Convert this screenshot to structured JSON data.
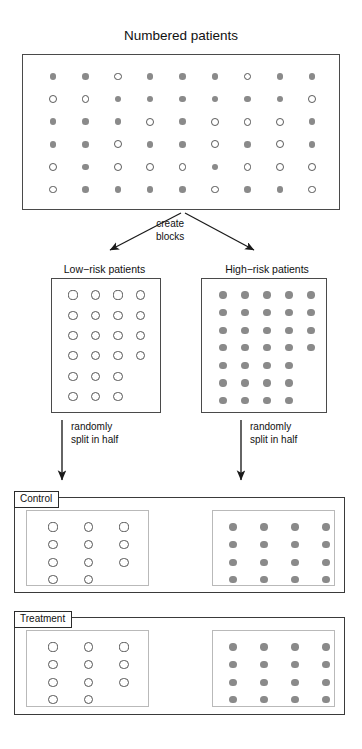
{
  "figure": {
    "title": "Numbered patients",
    "step_labels": {
      "create_blocks": "create\nblocks",
      "create_blocks_line1": "create",
      "create_blocks_line2": "blocks",
      "randomize_line1": "randomly",
      "randomize_line2": "split in half"
    },
    "block_labels": {
      "low": "Low−risk patients",
      "high": "High−risk patients"
    },
    "group_labels": {
      "control": "Control",
      "treatment": "Treatment"
    },
    "marker_legend": {
      "open": "low-risk patient",
      "filled": "high-risk patient"
    },
    "colors": {
      "filled_marker": "#8a8a8a",
      "open_marker_stroke": "#555555",
      "box_border": "#4a4a4a",
      "inner_box_border": "#b9b9b9",
      "arrow": "#1a1a1a",
      "background": "#ffffff",
      "text": "#111111"
    }
  },
  "chart_data": {
    "type": "diagram",
    "title": "Numbered patients",
    "marker_encoding": {
      "O": "open circle = low-risk patient",
      "F": "filled circle = high-risk patient"
    },
    "pool": {
      "label": "Numbered patients",
      "rows": 6,
      "cols": 9,
      "total": 54,
      "open_count": 22,
      "filled_count": 32,
      "grid": [
        [
          "F",
          "F",
          "O",
          "F",
          "F",
          "F",
          "O",
          "F",
          "F"
        ],
        [
          "O",
          "O",
          "F",
          "F",
          "F",
          "F",
          "F",
          "F",
          "O"
        ],
        [
          "F",
          "F",
          "F",
          "O",
          "F",
          "O",
          "O",
          "O",
          "F"
        ],
        [
          "F",
          "F",
          "O",
          "F",
          "F",
          "O",
          "F",
          "O",
          "F"
        ],
        [
          "O",
          "F",
          "O",
          "O",
          "O",
          "F",
          "O",
          "O",
          "O"
        ],
        [
          "O",
          "F",
          "F",
          "F",
          "F",
          "O",
          "F",
          "F",
          "O"
        ]
      ]
    },
    "blocks": [
      {
        "name": "Low−risk patients",
        "marker": "open",
        "total": 22,
        "row_counts": [
          4,
          4,
          4,
          4,
          3,
          3
        ]
      },
      {
        "name": "High−risk patients",
        "marker": "filled",
        "total": 32,
        "row_counts": [
          5,
          5,
          5,
          5,
          4,
          4,
          4
        ]
      }
    ],
    "groups": [
      {
        "name": "Control",
        "low_risk": {
          "marker": "open",
          "total": 11,
          "row_counts": [
            3,
            3,
            3,
            2
          ]
        },
        "high_risk": {
          "marker": "filled",
          "total": 16,
          "row_counts": [
            4,
            4,
            4,
            4
          ]
        }
      },
      {
        "name": "Treatment",
        "low_risk": {
          "marker": "open",
          "total": 11,
          "row_counts": [
            3,
            3,
            3,
            2
          ]
        },
        "high_risk": {
          "marker": "filled",
          "total": 16,
          "row_counts": [
            4,
            4,
            4,
            4
          ]
        }
      }
    ],
    "arrows": [
      {
        "from": "pool",
        "to": "Low−risk patients",
        "label": "create blocks"
      },
      {
        "from": "pool",
        "to": "High−risk patients",
        "label": "create blocks"
      },
      {
        "from": "Low−risk patients",
        "to": "Control / Treatment",
        "label": "randomly split in half"
      },
      {
        "from": "High−risk patients",
        "to": "Control / Treatment",
        "label": "randomly split in half"
      }
    ]
  }
}
